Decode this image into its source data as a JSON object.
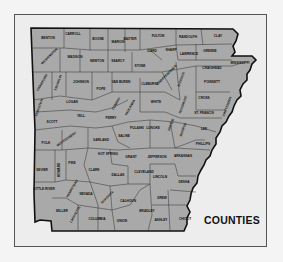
{
  "map": {
    "title": "COUNTIES",
    "state": "Arkansas",
    "colors": {
      "county_fill": "#a9a9a9",
      "border": "#111111",
      "background": "#ededed",
      "page": "#f4f4f4"
    },
    "counties": [
      {
        "name": "BENTON",
        "x": 48,
        "y": 39
      },
      {
        "name": "CARROLL",
        "x": 73,
        "y": 35
      },
      {
        "name": "BOONE",
        "x": 98,
        "y": 40
      },
      {
        "name": "MARION",
        "x": 118,
        "y": 43
      },
      {
        "name": "BAXTER",
        "x": 130,
        "y": 40
      },
      {
        "name": "FULTON",
        "x": 158,
        "y": 37
      },
      {
        "name": "RANDOLPH",
        "x": 188,
        "y": 38
      },
      {
        "name": "CLAY",
        "x": 218,
        "y": 37
      },
      {
        "name": "WASHINGTON",
        "x": 50,
        "y": 57,
        "rot": -45
      },
      {
        "name": "MADISON",
        "x": 75,
        "y": 58
      },
      {
        "name": "NEWTON",
        "x": 97,
        "y": 62
      },
      {
        "name": "SEARCY",
        "x": 118,
        "y": 62
      },
      {
        "name": "IZARD",
        "x": 152,
        "y": 52
      },
      {
        "name": "SHARP",
        "x": 171,
        "y": 51
      },
      {
        "name": "LAWRENCE",
        "x": 189,
        "y": 55
      },
      {
        "name": "GREENE",
        "x": 210,
        "y": 52
      },
      {
        "name": "STONE",
        "x": 140,
        "y": 67
      },
      {
        "name": "INDEPENDENCE",
        "x": 168,
        "y": 75,
        "rot": -45
      },
      {
        "name": "JACKSON",
        "x": 182,
        "y": 80,
        "rot": -70
      },
      {
        "name": "CRAIGHEAD",
        "x": 212,
        "y": 69
      },
      {
        "name": "MISSISSIPPI",
        "x": 240,
        "y": 64
      },
      {
        "name": "CRAWFORD",
        "x": 43,
        "y": 83,
        "rot": -60
      },
      {
        "name": "FRANKLIN",
        "x": 59,
        "y": 83,
        "rot": -70
      },
      {
        "name": "JOHNSON",
        "x": 81,
        "y": 83
      },
      {
        "name": "POPE",
        "x": 101,
        "y": 90
      },
      {
        "name": "VAN BUREN",
        "x": 121,
        "y": 83
      },
      {
        "name": "CLEBURNE",
        "x": 150,
        "y": 85
      },
      {
        "name": "POINSETT",
        "x": 212,
        "y": 83
      },
      {
        "name": "SEBASTIAN",
        "x": 40,
        "y": 108,
        "rot": -70
      },
      {
        "name": "LOGAN",
        "x": 72,
        "y": 103
      },
      {
        "name": "CONWAY",
        "x": 117,
        "y": 104,
        "rot": -60
      },
      {
        "name": "FAULKNER",
        "x": 131,
        "y": 108,
        "rot": -60
      },
      {
        "name": "WHITE",
        "x": 156,
        "y": 103
      },
      {
        "name": "WOODRUFF",
        "x": 184,
        "y": 105,
        "rot": -70
      },
      {
        "name": "CROSS",
        "x": 204,
        "y": 99
      },
      {
        "name": "CRITTENDEN",
        "x": 228,
        "y": 107,
        "rot": -70
      },
      {
        "name": "YELL",
        "x": 81,
        "y": 117
      },
      {
        "name": "PERRY",
        "x": 111,
        "y": 119
      },
      {
        "name": "ST. FRANCIS",
        "x": 204,
        "y": 114
      },
      {
        "name": "SCOTT",
        "x": 52,
        "y": 123
      },
      {
        "name": "PRAIRIE",
        "x": 172,
        "y": 125,
        "rot": -70
      },
      {
        "name": "PULASKI",
        "x": 137,
        "y": 129
      },
      {
        "name": "LONOKE",
        "x": 153,
        "y": 129
      },
      {
        "name": "MONROE",
        "x": 184,
        "y": 130,
        "rot": -70
      },
      {
        "name": "LEE",
        "x": 204,
        "y": 130
      },
      {
        "name": "POLK",
        "x": 46,
        "y": 144
      },
      {
        "name": "MONTGOMERY",
        "x": 67,
        "y": 140,
        "rot": -35
      },
      {
        "name": "GARLAND",
        "x": 101,
        "y": 141
      },
      {
        "name": "SALINE",
        "x": 124,
        "y": 137
      },
      {
        "name": "PHILLIPS",
        "x": 203,
        "y": 145
      },
      {
        "name": "HOT SPRING",
        "x": 108,
        "y": 155
      },
      {
        "name": "GRANT",
        "x": 131,
        "y": 158
      },
      {
        "name": "JEFFERSON",
        "x": 157,
        "y": 158
      },
      {
        "name": "ARKANSAS",
        "x": 183,
        "y": 157
      },
      {
        "name": "SEVIER",
        "x": 42,
        "y": 171
      },
      {
        "name": "HOWARD",
        "x": 60,
        "y": 170,
        "rot": -90
      },
      {
        "name": "PIKE",
        "x": 72,
        "y": 164
      },
      {
        "name": "CLARK",
        "x": 94,
        "y": 171
      },
      {
        "name": "DALLAS",
        "x": 118,
        "y": 176
      },
      {
        "name": "CLEVELAND",
        "x": 144,
        "y": 173
      },
      {
        "name": "LINCOLN",
        "x": 160,
        "y": 178
      },
      {
        "name": "DESHA",
        "x": 184,
        "y": 183
      },
      {
        "name": "LITTLE RIVER",
        "x": 44,
        "y": 190
      },
      {
        "name": "HEMPSTEAD",
        "x": 73,
        "y": 189,
        "rot": -60
      },
      {
        "name": "NEVADA",
        "x": 86,
        "y": 195
      },
      {
        "name": "OUACHITA",
        "x": 108,
        "y": 198,
        "rot": -45
      },
      {
        "name": "CALHOUN",
        "x": 128,
        "y": 202
      },
      {
        "name": "DREW",
        "x": 162,
        "y": 199
      },
      {
        "name": "MILLER",
        "x": 62,
        "y": 212
      },
      {
        "name": "LAFAYETTE",
        "x": 76,
        "y": 215,
        "rot": -60
      },
      {
        "name": "COLUMBIA",
        "x": 97,
        "y": 220
      },
      {
        "name": "UNION",
        "x": 122,
        "y": 222
      },
      {
        "name": "BRADLEY",
        "x": 147,
        "y": 212
      },
      {
        "name": "ASHLEY",
        "x": 161,
        "y": 221
      },
      {
        "name": "CHICOT",
        "x": 185,
        "y": 220
      }
    ]
  }
}
